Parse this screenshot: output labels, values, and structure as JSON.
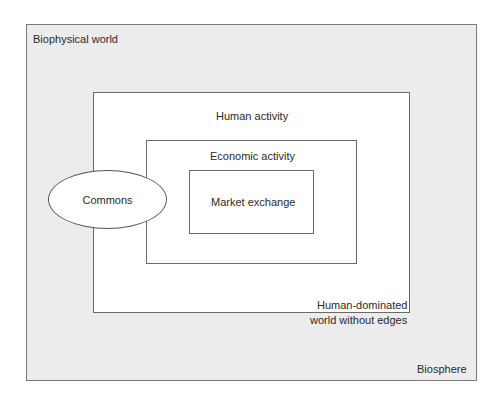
{
  "diagram": {
    "biosphere": {
      "title": "Biophysical world",
      "footer": "Biosphere"
    },
    "human": {
      "title": "Human activity",
      "footer_line1": "Human-dominated",
      "footer_line2": "world without edges"
    },
    "economic": {
      "title": "Economic activity"
    },
    "market": {
      "title": "Market exchange"
    },
    "commons": {
      "title": "Commons"
    }
  },
  "colors": {
    "outer_fill": "#ececec",
    "inner_fill": "#ffffff",
    "border": "#6a6a6a"
  }
}
